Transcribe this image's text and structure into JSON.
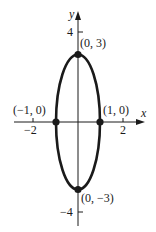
{
  "diagram": {
    "type": "ellipse-graph",
    "equation_shape": "vertical ellipse centered at origin",
    "axes": {
      "x_label": "x",
      "y_label": "y",
      "x_ticks": [
        {
          "value": -2,
          "label": "−2"
        },
        {
          "value": 2,
          "label": "2"
        }
      ],
      "y_ticks": [
        {
          "value": 4,
          "label": "4"
        },
        {
          "value": -4,
          "label": "−4"
        }
      ]
    },
    "points": [
      {
        "x": 0,
        "y": 3,
        "label": "(0, 3)"
      },
      {
        "x": 1,
        "y": 0,
        "label": "(1, 0)"
      },
      {
        "x": -1,
        "y": 0,
        "label": "(−1, 0)"
      },
      {
        "x": 0,
        "y": -3,
        "label": "(0, −3)"
      }
    ],
    "ellipse": {
      "a_x": 1,
      "b_y": 3
    },
    "colors": {
      "stroke": "#1a1a1a",
      "background": "#ffffff"
    }
  }
}
